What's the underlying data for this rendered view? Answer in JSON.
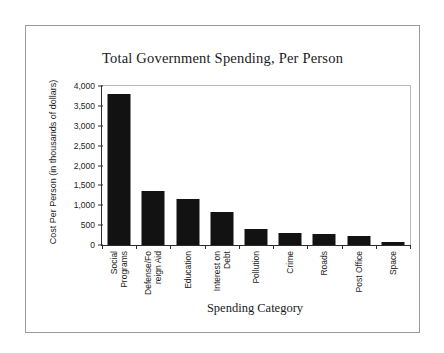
{
  "chart_data": {
    "type": "bar",
    "title": "Total Government Spending, Per Person",
    "xlabel": "Spending Category",
    "ylabel": "Cost Per Person (in thousands of dollars)",
    "categories": [
      "Social Programs",
      "Defense/Foreign Aid",
      "Education",
      "Interest on Debt",
      "Pollution",
      "Crime",
      "Roads",
      "Post Office",
      "Space"
    ],
    "category_lines": [
      [
        "Social",
        "Programs"
      ],
      [
        "Defense/Fo",
        "reign Aid"
      ],
      [
        "Education"
      ],
      [
        "Interest on",
        "Debt"
      ],
      [
        "Pollution"
      ],
      [
        "Crime"
      ],
      [
        "Roads"
      ],
      [
        "Post Office"
      ],
      [
        "Space"
      ]
    ],
    "values": [
      3800,
      1350,
      1150,
      830,
      400,
      300,
      285,
      225,
      80
    ],
    "ylim": [
      0,
      4000
    ],
    "ytick_values": [
      0,
      500,
      1000,
      1500,
      2000,
      2500,
      3000,
      3500,
      4000
    ],
    "ytick_labels": [
      "0",
      "500",
      "1,000",
      "1,500",
      "2,000",
      "2,500",
      "3,000",
      "3,500",
      "4,000"
    ],
    "grid": false,
    "legend": null,
    "bar_color": "#121212",
    "axis_color": "#2b2b2b",
    "frame_color": "#9a9a9a"
  }
}
